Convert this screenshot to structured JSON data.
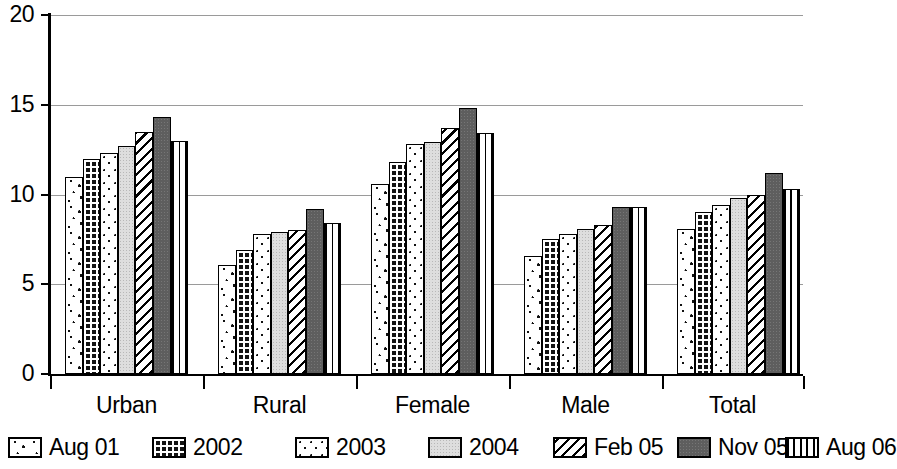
{
  "chart_data": {
    "type": "bar",
    "title": "",
    "subtitle": "",
    "xlabel": "",
    "ylabel": "",
    "ylim": [
      0,
      20
    ],
    "yticks": [
      0,
      5,
      10,
      15,
      20
    ],
    "ytick_labels": [
      "0",
      "5",
      "10",
      "15",
      "20"
    ],
    "grid": true,
    "legend_position": "bottom",
    "categories": [
      "Urban",
      "Rural",
      "Female",
      "Male",
      "Total"
    ],
    "series": [
      {
        "name": "Aug 01",
        "pattern": "sparse-dots",
        "values": [
          11.0,
          6.1,
          10.6,
          6.6,
          8.1
        ]
      },
      {
        "name": "2002",
        "pattern": "dark-grid",
        "values": [
          12.0,
          6.9,
          11.8,
          7.5,
          9.0
        ]
      },
      {
        "name": "2003",
        "pattern": "fine-dots",
        "values": [
          12.3,
          7.8,
          12.8,
          7.8,
          9.4
        ]
      },
      {
        "name": "2004",
        "pattern": "light-gray-solid",
        "values": [
          12.7,
          7.9,
          12.9,
          8.1,
          9.8
        ]
      },
      {
        "name": "Feb 05",
        "pattern": "diagonal-hatch",
        "values": [
          13.5,
          8.0,
          13.7,
          8.3,
          10.0
        ]
      },
      {
        "name": "Nov 05",
        "pattern": "dark-gray-solid",
        "values": [
          14.3,
          9.2,
          14.8,
          9.3,
          11.2
        ]
      },
      {
        "name": "Aug 06",
        "pattern": "vertical-stripes",
        "values": [
          13.0,
          8.4,
          13.4,
          9.3,
          10.3
        ]
      }
    ]
  },
  "axis": {
    "y_tick_labels": [
      "20",
      "15",
      "10",
      "5",
      "0"
    ],
    "x_category_labels": [
      "Urban",
      "Rural",
      "Female",
      "Male",
      "Total"
    ]
  },
  "legend": {
    "items": [
      {
        "label": "Aug 01",
        "pattern": "sparse-dots"
      },
      {
        "label": "2002",
        "pattern": "dark-grid"
      },
      {
        "label": "2003",
        "pattern": "fine-dots"
      },
      {
        "label": "2004",
        "pattern": "light-gray-solid"
      },
      {
        "label": "Feb 05",
        "pattern": "diagonal-hatch"
      },
      {
        "label": "Nov 05",
        "pattern": "dark-gray-solid"
      },
      {
        "label": "Aug 06",
        "pattern": "vertical-stripes"
      }
    ]
  },
  "colors": {
    "axis": "#000000",
    "gridline": "#9a9a9a",
    "background": "#ffffff",
    "light_gray_fill": "#dedede",
    "dark_gray_fill": "#5e5e5e",
    "dark_grid_fill": "#141414"
  }
}
